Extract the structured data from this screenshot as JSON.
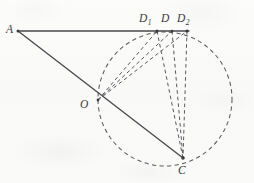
{
  "figure": {
    "kind": "geometry-diagram",
    "caption_text": "",
    "ink_color": "#4a4a4e",
    "dash_color": "#57575c",
    "paper_color": "#fbfbfa",
    "points": [
      {
        "id": "A",
        "label": "A",
        "sub": "",
        "x": 18,
        "y": 31,
        "label_x": 6,
        "label_y": 24
      },
      {
        "id": "D1",
        "label": "D",
        "sub": "1",
        "x": 157,
        "y": 31,
        "label_x": 139,
        "label_y": 13
      },
      {
        "id": "D",
        "label": "D",
        "sub": "",
        "x": 172,
        "y": 31,
        "label_x": 161,
        "label_y": 13
      },
      {
        "id": "D2",
        "label": "D",
        "sub": "2",
        "x": 187,
        "y": 31,
        "label_x": 177,
        "label_y": 13
      },
      {
        "id": "O",
        "label": "O",
        "sub": "",
        "x": 98,
        "y": 100,
        "label_x": 80,
        "label_y": 99
      },
      {
        "id": "C",
        "label": "C",
        "sub": "",
        "x": 183,
        "y": 158,
        "label_x": 178,
        "label_y": 165
      }
    ],
    "circle": {
      "cx": 165,
      "cy": 99,
      "r": 67,
      "style": "dashed"
    },
    "solid_segments": [
      {
        "from": "A",
        "to": "D2"
      },
      {
        "from": "A",
        "to": "C"
      }
    ],
    "dashed_segments": [
      {
        "from": "O",
        "to": "D1"
      },
      {
        "from": "O",
        "to": "D"
      },
      {
        "from": "O",
        "to": "D2"
      },
      {
        "from": "D1",
        "to": "C"
      },
      {
        "from": "D",
        "to": "C"
      },
      {
        "from": "D2",
        "to": "C"
      }
    ],
    "labels": {
      "A": "A",
      "D1_base": "D",
      "D1_sub": "1",
      "D_base": "D",
      "D2_base": "D",
      "D2_sub": "2",
      "O": "O",
      "C": "C"
    }
  }
}
